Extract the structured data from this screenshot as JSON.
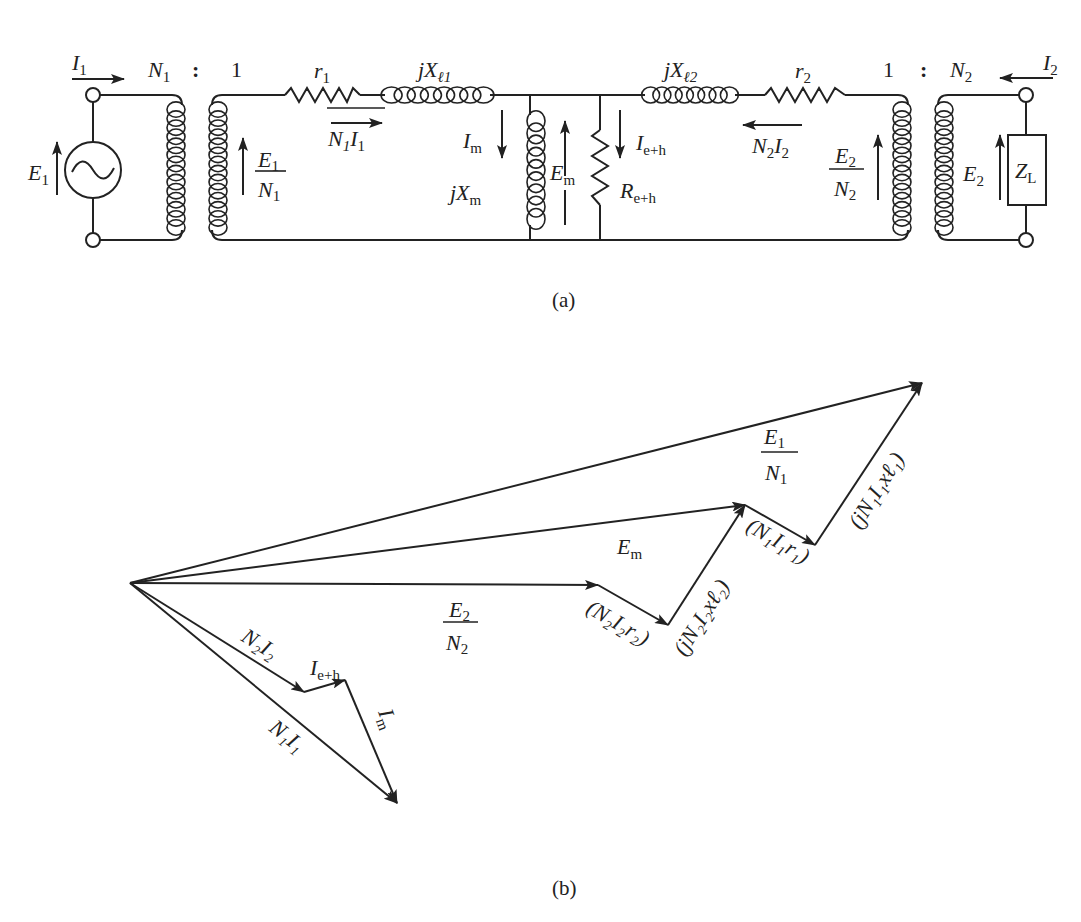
{
  "figure": {
    "caption_a": "(a)",
    "caption_b": "(b)"
  },
  "circuit": {
    "source": {
      "voltage": "E",
      "voltage_sub": "1",
      "current": "I",
      "current_sub": "1",
      "icon": "ac-source-icon"
    },
    "transformer1": {
      "ratio_left": "N",
      "ratio_left_sub": "1",
      "colon": ":",
      "ratio_right": "1"
    },
    "transformer2": {
      "ratio_left": "1",
      "colon": ":",
      "ratio_right": "N",
      "ratio_right_sub": "2"
    },
    "primary_emf": {
      "num": "E",
      "num_sub": "1",
      "den": "N",
      "den_sub": "1"
    },
    "secondary_emf": {
      "num": "E",
      "num_sub": "2",
      "den": "N",
      "den_sub": "2"
    },
    "r1": {
      "sym": "r",
      "sub": "1"
    },
    "xl1": {
      "sym": "jX",
      "sub": "ℓ1"
    },
    "primary_current": {
      "a": "N",
      "a_sub": "1",
      "b": "I",
      "b_sub": "1"
    },
    "magnetizing": {
      "current": "I",
      "current_sub": "m",
      "reactance": "jX",
      "reactance_sub": "m"
    },
    "core_voltage": {
      "sym": "E",
      "sub": "m"
    },
    "core_loss": {
      "current": "I",
      "current_sub": "e+h",
      "resistance": "R",
      "resistance_sub": "e+h"
    },
    "xl2": {
      "sym": "jX",
      "sub": "ℓ2"
    },
    "r2": {
      "sym": "r",
      "sub": "2"
    },
    "secondary_current": {
      "a": "N",
      "a_sub": "2",
      "b": "I",
      "b_sub": "2"
    },
    "load": {
      "voltage": "E",
      "voltage_sub": "2",
      "current": "I",
      "current_sub": "2",
      "impedance": "Z",
      "impedance_sub": "L"
    }
  },
  "phasor": {
    "vectors": [
      {
        "name": "E1/N1",
        "from": [
          0,
          0
        ],
        "to": [
          792,
          200
        ]
      },
      {
        "name": "Em",
        "from": [
          0,
          0
        ],
        "to": [
          615,
          78
        ]
      },
      {
        "name": "E2/N2",
        "from": [
          0,
          0
        ],
        "to": [
          468,
          -2
        ]
      },
      {
        "name": "N2I2r2",
        "from": [
          468,
          -2
        ],
        "to": [
          538,
          -42
        ]
      },
      {
        "name": "jN2I2xl2",
        "from": [
          538,
          -42
        ],
        "to": [
          615,
          78
        ]
      },
      {
        "name": "N1I1r1",
        "from": [
          615,
          78
        ],
        "to": [
          685,
          38
        ]
      },
      {
        "name": "jN1I1xl1",
        "from": [
          685,
          38
        ],
        "to": [
          792,
          200
        ]
      },
      {
        "name": "N2I2",
        "from": [
          0,
          0
        ],
        "to": [
          174,
          -109
        ]
      },
      {
        "name": "Ie+h",
        "from": [
          174,
          -109
        ],
        "to": [
          215,
          -97
        ]
      },
      {
        "name": "Im",
        "from": [
          215,
          -97
        ],
        "to": [
          267,
          -220
        ]
      },
      {
        "name": "N1I1",
        "from": [
          0,
          0
        ],
        "to": [
          267,
          -220
        ]
      }
    ],
    "labels": {
      "e1n1": {
        "num": "E",
        "num_sub": "1",
        "den": "N",
        "den_sub": "1"
      },
      "em": {
        "sym": "E",
        "sub": "m"
      },
      "e2n2": {
        "num": "E",
        "num_sub": "2",
        "den": "N",
        "den_sub": "2"
      },
      "n2i2r2": "(N₂I₂r₂)",
      "jn2i2x2": "(jN₂I₂xℓ₂)",
      "n1i1r1": "(N₁I₁r₁)",
      "jn1i1x1": "(jN₁I₁xℓ₁)",
      "n2i2": "N₂I₂",
      "ieh": {
        "sym": "I",
        "sub": "e+h"
      },
      "im": {
        "sym": "I",
        "sub": "m"
      },
      "n1i1": "N₁I₁"
    }
  }
}
